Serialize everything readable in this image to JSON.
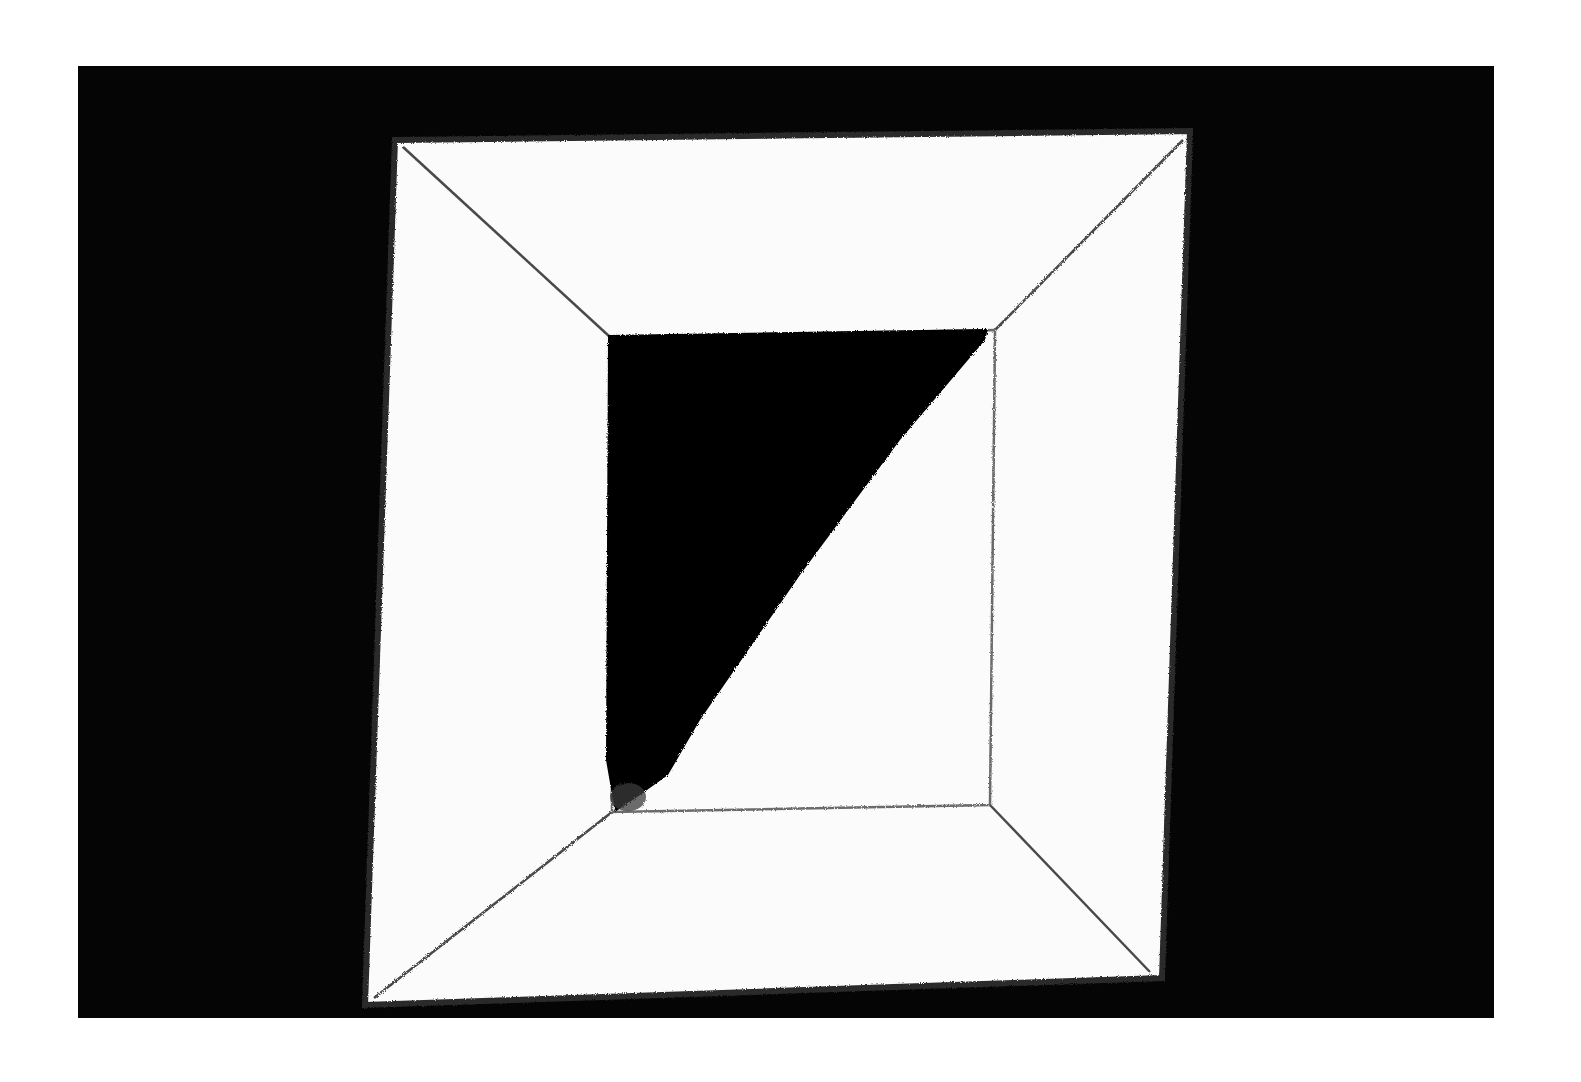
{
  "image": {
    "description": "Black-and-white photograph of an abstract painting: a white square canvas on a black ground, drawn as a framed square with diagonal lines from its corners to an inner square; the upper-left half of the inner square is filled black.",
    "colors": {
      "page_background": "#ffffff",
      "ground": "#050505",
      "canvas": "#fbfbfb",
      "line": "#555555",
      "triangle": "#050505"
    },
    "ground_rect": [
      78,
      66,
      1494,
      1018
    ],
    "canvas_corners": [
      [
        395,
        140
      ],
      [
        1190,
        131
      ],
      [
        1162,
        978
      ],
      [
        365,
        1005
      ]
    ],
    "inner_square_corners": [
      [
        610,
        337
      ],
      [
        995,
        330
      ],
      [
        990,
        805
      ],
      [
        612,
        812
      ]
    ],
    "black_triangle": [
      [
        610,
        337
      ],
      [
        985,
        333
      ],
      [
        660,
        778
      ],
      [
        614,
        810
      ]
    ]
  }
}
